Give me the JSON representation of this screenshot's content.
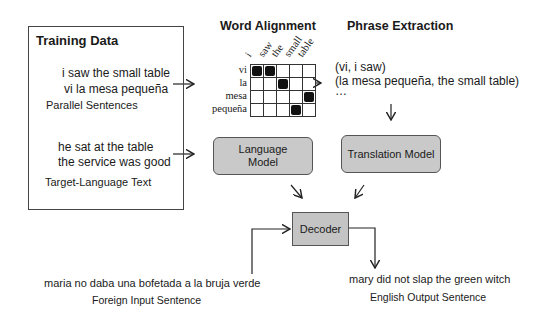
{
  "training_data": {
    "title": "Training Data",
    "parallel": {
      "english": "i saw the small table",
      "spanish": "vi la mesa pequeña",
      "caption": "Parallel Sentences"
    },
    "target": {
      "line1": "he sat at the table",
      "line2": "the service was good",
      "caption": "Target-Language Text"
    }
  },
  "word_alignment": {
    "title": "Word Alignment",
    "columns": [
      "i",
      "saw",
      "the",
      "small",
      "table"
    ],
    "rows": [
      "vi",
      "la",
      "mesa",
      "pequeña"
    ],
    "alignments": [
      [
        1,
        1,
        0,
        0,
        0
      ],
      [
        0,
        0,
        1,
        0,
        0
      ],
      [
        0,
        0,
        0,
        0,
        1
      ],
      [
        0,
        0,
        0,
        1,
        0
      ]
    ]
  },
  "phrase_extraction": {
    "title": "Phrase Extraction",
    "phrases": [
      "(vi, i saw)",
      "(la mesa pequeña, the small table)",
      "…"
    ]
  },
  "language_model": {
    "line1": "Language",
    "line2": "Model"
  },
  "translation_model": {
    "label": "Translation Model"
  },
  "decoder": {
    "label": "Decoder"
  },
  "input": {
    "sentence": "maria no daba una bofetada a la bruja verde",
    "caption": "Foreign Input Sentence"
  },
  "output": {
    "sentence": "mary did not slap the green witch",
    "caption": "English Output Sentence"
  },
  "colors": {
    "box_fill": "#c9c9c9",
    "line": "#222222"
  }
}
